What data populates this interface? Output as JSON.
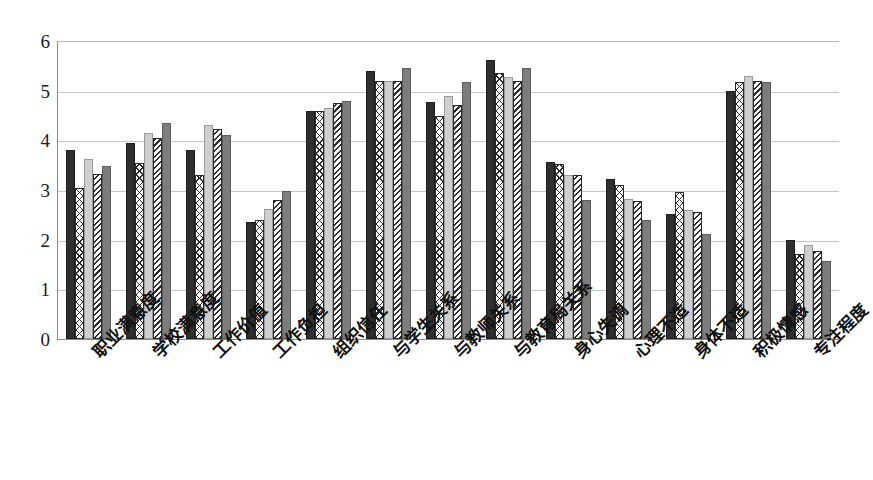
{
  "chart_data": {
    "type": "bar",
    "title": "",
    "subtitle": "",
    "xlabel": "",
    "ylabel": "",
    "ylim": [
      0,
      6
    ],
    "yticks": [
      "0",
      "1",
      "2",
      "3",
      "4",
      "5",
      "6"
    ],
    "grid": true,
    "legend_position": "none",
    "orientation": "vertical",
    "grouping": "clustered",
    "categories": [
      "职业满意度",
      "学校满意度",
      "工作价值",
      "工作负担",
      "组织信任",
      "与学生关系",
      "与教师关系",
      "与教育局关系",
      "身心失调",
      "心理不适",
      "身体不适",
      "积极情感",
      "专注程度"
    ],
    "series": [
      {
        "name": "series-1",
        "fill": "solid-dark",
        "color": "#2f2f2f",
        "values": [
          3.8,
          3.95,
          3.8,
          2.35,
          4.6,
          5.4,
          4.78,
          5.62,
          3.57,
          3.22,
          2.52,
          5.0,
          2.0
        ]
      },
      {
        "name": "series-2",
        "fill": "cross-hatch",
        "color": "#ffffff",
        "values": [
          3.05,
          3.55,
          3.3,
          2.4,
          4.6,
          5.2,
          4.5,
          5.35,
          3.52,
          3.1,
          2.95,
          5.18,
          1.72
        ]
      },
      {
        "name": "series-3",
        "fill": "solid-light-gray",
        "color": "#cfcfcf",
        "values": [
          3.62,
          4.15,
          4.3,
          2.62,
          4.65,
          5.2,
          4.9,
          5.28,
          3.3,
          2.82,
          2.6,
          5.3,
          1.9
        ]
      },
      {
        "name": "series-4",
        "fill": "diagonal-hatch",
        "color": "#ffffff",
        "values": [
          3.32,
          4.05,
          4.22,
          2.8,
          4.75,
          5.2,
          4.72,
          5.2,
          3.3,
          2.78,
          2.55,
          5.2,
          1.78
        ]
      },
      {
        "name": "series-5",
        "fill": "solid-mid-gray",
        "color": "#7d7d7d",
        "values": [
          3.48,
          4.35,
          4.1,
          2.98,
          4.8,
          5.45,
          5.18,
          5.45,
          2.8,
          2.4,
          2.12,
          5.18,
          1.58
        ]
      }
    ]
  },
  "colors": {
    "series_1": "#2f2f2f",
    "series_2": "#ffffff",
    "series_3": "#cfcfcf",
    "series_4": "#ffffff",
    "series_5": "#7d7d7d",
    "axis": "#8a8a8a",
    "grid": "#c6c6c6",
    "text": "#111111"
  },
  "top_cropped_text": ""
}
